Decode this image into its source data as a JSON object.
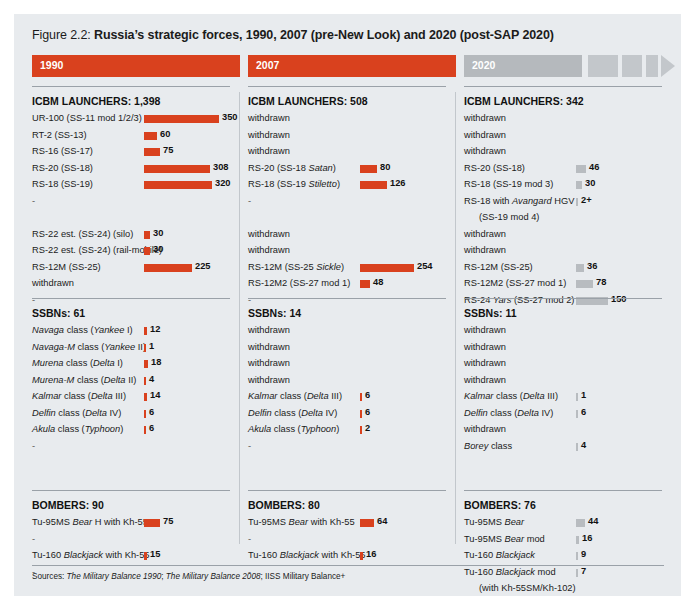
{
  "figure": {
    "label": "Figure 2.2:",
    "title": "Russia’s strategic forces, 1990, 2007 (pre-New Look) and 2020 (post-SAP 2020)"
  },
  "colors": {
    "panel_bg": "#e8ebee",
    "accent_red": "#d9411e",
    "accent_grey": "#b8bcc0",
    "band_red": "#d9411e",
    "band_grey": "#b5b9bd",
    "rule": "#9aa1a8",
    "text": "#1b1b1b"
  },
  "band": {
    "segments": [
      {
        "label": "1990",
        "color": "#d9411e",
        "x": 0,
        "width": 208
      },
      {
        "label": "2007",
        "color": "#d9411e",
        "x": 216,
        "width": 208
      },
      {
        "label": "2020",
        "color": "#b5b9bd",
        "x": 432,
        "width": 118
      },
      {
        "label": "",
        "color": "#c3c7cb",
        "x": 556,
        "width": 30
      },
      {
        "label": "",
        "color": "#c3c7cb",
        "x": 590,
        "width": 20
      },
      {
        "label": "",
        "color": "#c3c7cb",
        "x": 614,
        "width": 12
      }
    ],
    "arrow": {
      "x": 629,
      "color": "#c3c7cb"
    }
  },
  "scale": {
    "px_per_unit": 0.214,
    "bar_origin_px": 112,
    "min_bar_px": 2
  },
  "footer": {
    "sources_prefix": "Sources: ",
    "source_1": "The Military Balance 1990",
    "sep_1": "; ",
    "source_2": "The Military Balance 2008",
    "sep_2": "; ",
    "source_3": "IISS Military Balance+"
  },
  "chart_data": {
    "type": "bar",
    "title": "Russia’s strategic forces, 1990, 2007 (pre-New Look) and 2020 (post-SAP 2020)",
    "xlabel": "",
    "ylabel": "",
    "orientation": "horizontal",
    "grid": false,
    "legend": "none",
    "columns": [
      {
        "year": "1990",
        "color": "#d9411e",
        "sections": [
          {
            "title": "ICBM LAUNCHERS: 1,398",
            "total": 1398,
            "rows": [
              {
                "label": "UR-100 (SS-11 mod 1/2/3)",
                "value": 350,
                "display": "350"
              },
              {
                "label": "RT-2 (SS-13)",
                "value": 60,
                "display": "60"
              },
              {
                "label": "RS-16 (SS-17)",
                "value": 75,
                "display": "75"
              },
              {
                "label": "RS-20 (SS-18)",
                "value": 308,
                "display": "308"
              },
              {
                "label": "RS-18 (SS-19)",
                "value": 320,
                "display": "320"
              },
              {
                "label": "-",
                "value": null,
                "display": ""
              },
              {
                "label": "",
                "value": null,
                "display": ""
              },
              {
                "label": "RS-22 est. (SS-24) (silo)",
                "value": 30,
                "display": "30"
              },
              {
                "label": "RS-22 est. (SS-24) (rail-mobile)",
                "value": 30,
                "display": "30"
              },
              {
                "label": "RS-12M (SS-25)",
                "value": 225,
                "display": "225"
              },
              {
                "label": "withdrawn",
                "value": null,
                "display": ""
              },
              {
                "label": "-",
                "value": null,
                "display": ""
              }
            ]
          },
          {
            "title": "SSBNs: 61",
            "total": 61,
            "rows": [
              {
                "label": "Navaga class (Yankee I)",
                "value": 12,
                "display": "12",
                "italic_parts": [
                  "Navaga",
                  "Yankee"
                ]
              },
              {
                "label": "Navaga-M class (Yankee II)",
                "value": 1,
                "display": "1",
                "italic_parts": [
                  "Navaga-M",
                  "Yankee"
                ]
              },
              {
                "label": "Murena class (Delta I)",
                "value": 18,
                "display": "18",
                "italic_parts": [
                  "Murena",
                  "Delta"
                ]
              },
              {
                "label": "Murena-M class (Delta II)",
                "value": 4,
                "display": "4",
                "italic_parts": [
                  "Murena-M",
                  "Delta"
                ]
              },
              {
                "label": "Kalmar class (Delta III)",
                "value": 14,
                "display": "14",
                "italic_parts": [
                  "Kalmar",
                  "Delta"
                ]
              },
              {
                "label": "Delfin class (Delta IV)",
                "value": 6,
                "display": "6",
                "italic_parts": [
                  "Delfin",
                  "Delta"
                ]
              },
              {
                "label": "Akula class (Typhoon)",
                "value": 6,
                "display": "6",
                "italic_parts": [
                  "Akula",
                  "Typhoon"
                ]
              },
              {
                "label": "-",
                "value": null,
                "display": ""
              }
            ]
          },
          {
            "title": "BOMBERS: 90",
            "total": 90,
            "rows": [
              {
                "label": "Tu-95MS Bear H with Kh-55",
                "value": 75,
                "display": "75",
                "italic_parts": [
                  "Bear"
                ]
              },
              {
                "label": "-",
                "value": null,
                "display": ""
              },
              {
                "label": "Tu-160 Blackjack with Kh-55",
                "value": 15,
                "display": "15",
                "italic_parts": [
                  "Blackjack"
                ]
              },
              {
                "label": "-",
                "value": null,
                "display": ""
              }
            ]
          }
        ]
      },
      {
        "year": "2007",
        "color": "#d9411e",
        "sections": [
          {
            "title": "ICBM LAUNCHERS: 508",
            "total": 508,
            "rows": [
              {
                "label": "withdrawn",
                "value": null,
                "display": ""
              },
              {
                "label": "withdrawn",
                "value": null,
                "display": ""
              },
              {
                "label": "withdrawn",
                "value": null,
                "display": ""
              },
              {
                "label": "RS-20 (SS-18 Satan)",
                "value": 80,
                "display": "80",
                "italic_parts": [
                  "Satan"
                ]
              },
              {
                "label": "RS-18 (SS-19 Stiletto)",
                "value": 126,
                "display": "126",
                "italic_parts": [
                  "Stiletto"
                ]
              },
              {
                "label": "-",
                "value": null,
                "display": ""
              },
              {
                "label": "",
                "value": null,
                "display": ""
              },
              {
                "label": "withdrawn",
                "value": null,
                "display": ""
              },
              {
                "label": "withdrawn",
                "value": null,
                "display": ""
              },
              {
                "label": "RS-12M (SS-25 Sickle)",
                "value": 254,
                "display": "254",
                "italic_parts": [
                  "Sickle"
                ]
              },
              {
                "label": "RS-12M2 (SS-27 mod 1)",
                "value": 48,
                "display": "48"
              },
              {
                "label": "-",
                "value": null,
                "display": ""
              }
            ]
          },
          {
            "title": "SSBNs: 14",
            "total": 14,
            "rows": [
              {
                "label": "withdrawn",
                "value": null,
                "display": ""
              },
              {
                "label": "withdrawn",
                "value": null,
                "display": ""
              },
              {
                "label": "withdrawn",
                "value": null,
                "display": ""
              },
              {
                "label": "withdrawn",
                "value": null,
                "display": ""
              },
              {
                "label": "Kalmar class (Delta III)",
                "value": 6,
                "display": "6",
                "italic_parts": [
                  "Kalmar",
                  "Delta"
                ]
              },
              {
                "label": "Delfin class (Delta IV)",
                "value": 6,
                "display": "6",
                "italic_parts": [
                  "Delfin",
                  "Delta"
                ]
              },
              {
                "label": "Akula class (Typhoon)",
                "value": 2,
                "display": "2",
                "italic_parts": [
                  "Akula",
                  "Typhoon"
                ]
              },
              {
                "label": "-",
                "value": null,
                "display": ""
              }
            ]
          },
          {
            "title": "BOMBERS: 80",
            "total": 80,
            "rows": [
              {
                "label": "Tu-95MS Bear with Kh-55",
                "value": 64,
                "display": "64",
                "italic_parts": [
                  "Bear"
                ]
              },
              {
                "label": "-",
                "value": null,
                "display": ""
              },
              {
                "label": "Tu-160 Blackjack with Kh-55",
                "value": 16,
                "display": "16",
                "italic_parts": [
                  "Blackjack"
                ]
              },
              {
                "label": "-",
                "value": null,
                "display": ""
              }
            ]
          }
        ]
      },
      {
        "year": "2020",
        "color": "#b8bcc0",
        "sections": [
          {
            "title": "ICBM LAUNCHERS: 342",
            "total": 342,
            "rows": [
              {
                "label": "withdrawn",
                "value": null,
                "display": ""
              },
              {
                "label": "withdrawn",
                "value": null,
                "display": ""
              },
              {
                "label": "withdrawn",
                "value": null,
                "display": ""
              },
              {
                "label": "RS-20 (SS-18)",
                "value": 46,
                "display": "46"
              },
              {
                "label": "RS-18 (SS-19 mod 3)",
                "value": 30,
                "display": "30"
              },
              {
                "label": "RS-18 with Avangard HGV",
                "value": 2,
                "display": "2+",
                "italic_parts": [
                  "Avangard"
                ]
              },
              {
                "label": "(SS-19 mod 4)",
                "value": null,
                "display": "",
                "indent": true
              },
              {
                "label": "withdrawn",
                "value": null,
                "display": ""
              },
              {
                "label": "withdrawn",
                "value": null,
                "display": ""
              },
              {
                "label": "RS-12M (SS-25)",
                "value": 36,
                "display": "36"
              },
              {
                "label": "RS-12M2 (SS-27 mod 1)",
                "value": 78,
                "display": "78"
              },
              {
                "label": "RS-24 Yars (SS-27 mod 2)",
                "value": 150,
                "display": "150",
                "italic_parts": [
                  "Yars"
                ]
              }
            ]
          },
          {
            "title": "SSBNs: 11",
            "total": 11,
            "rows": [
              {
                "label": "withdrawn",
                "value": null,
                "display": ""
              },
              {
                "label": "withdrawn",
                "value": null,
                "display": ""
              },
              {
                "label": "withdrawn",
                "value": null,
                "display": ""
              },
              {
                "label": "withdrawn",
                "value": null,
                "display": ""
              },
              {
                "label": "Kalmar class (Delta III)",
                "value": 1,
                "display": "1",
                "italic_parts": [
                  "Kalmar",
                  "Delta"
                ]
              },
              {
                "label": "Delfin class (Delta IV)",
                "value": 6,
                "display": "6",
                "italic_parts": [
                  "Delfin",
                  "Delta"
                ]
              },
              {
                "label": "withdrawn",
                "value": null,
                "display": ""
              },
              {
                "label": "Borey class",
                "value": 4,
                "display": "4",
                "italic_parts": [
                  "Borey"
                ]
              }
            ]
          },
          {
            "title": "BOMBERS: 76",
            "total": 76,
            "rows": [
              {
                "label": "Tu-95MS Bear",
                "value": 44,
                "display": "44",
                "italic_parts": [
                  "Bear"
                ]
              },
              {
                "label": "Tu-95MS Bear mod",
                "value": 16,
                "display": "16",
                "italic_parts": [
                  "Bear"
                ]
              },
              {
                "label": "Tu-160 Blackjack",
                "value": 9,
                "display": "9",
                "italic_parts": [
                  "Blackjack"
                ]
              },
              {
                "label": "Tu-160 Blackjack mod",
                "value": 7,
                "display": "7",
                "italic_parts": [
                  "Blackjack"
                ]
              },
              {
                "label": "(with Kh-55SM/Kh-102)",
                "value": null,
                "display": "",
                "indent": true
              }
            ]
          }
        ]
      }
    ]
  }
}
